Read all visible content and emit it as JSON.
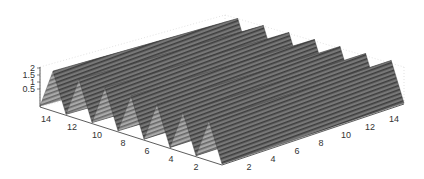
{
  "chart_data": {
    "type": "surface3d",
    "title": "",
    "xlabel": "",
    "ylabel": "",
    "zlabel": "",
    "x_range": [
      1,
      15
    ],
    "y_range": [
      1,
      15
    ],
    "zlim": [
      0,
      2
    ],
    "grid": true,
    "colormap": "gray",
    "function_description": "periodic ridges: z = 1 + cos(pi*(x+y)) style corrugated surface with fine stripes",
    "x_ticks": [
      "2",
      "4",
      "6",
      "8",
      "10",
      "12",
      "14"
    ],
    "y_ticks": [
      "14",
      "12",
      "10",
      "8",
      "6",
      "4",
      "2"
    ],
    "z_ticks": [
      "2",
      "1.5",
      "1",
      "0.5"
    ],
    "view": {
      "azimuth": -45,
      "elevation": 30
    },
    "ridge_count": 7
  },
  "axes": {
    "left_axis_labels": [
      "14",
      "12",
      "10",
      "8",
      "6",
      "4",
      "2"
    ],
    "right_axis_labels": [
      "2",
      "4",
      "6",
      "8",
      "10",
      "12",
      "14"
    ],
    "z_axis_labels": [
      "2",
      "1.5",
      "1",
      "0.5"
    ]
  }
}
